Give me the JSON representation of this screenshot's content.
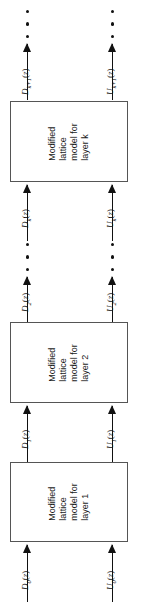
{
  "diagram": {
    "orientation": "rotated-90",
    "background_color": "#ffffff",
    "line_color": "#111111",
    "box_border_color": "#555555",
    "blocks": [
      {
        "id": "layer-k",
        "label": "Modified\nlattice\nmodel for\nlayer k",
        "line1": "Modified",
        "line2": "lattice",
        "line3": "model for",
        "line4": "layer k"
      },
      {
        "id": "layer-2",
        "label": "Modified\nlattice\nmodel for\nlayer 2",
        "line1": "Modified",
        "line2": "lattice",
        "line3": "model for",
        "line4": "layer 2"
      },
      {
        "id": "layer-1",
        "label": "Modified\nlattice\nmodel for\nlayer 1",
        "line1": "Modified",
        "line2": "lattice",
        "line3": "model for",
        "line4": "layer 1"
      }
    ],
    "signals": [
      {
        "id": "d-k-plus-1",
        "base": "D",
        "sub": "k+1",
        "arg": "(z)",
        "text": "D_{k+1}(z)"
      },
      {
        "id": "u-k-plus-1",
        "base": "U",
        "sub": "k+1",
        "arg": "(z)",
        "text": "U_{k+1}(z)"
      },
      {
        "id": "d-k",
        "base": "D",
        "sub": "k",
        "arg": "(z)",
        "text": "D_k(z)"
      },
      {
        "id": "u-k",
        "base": "U",
        "sub": "k",
        "arg": "(z)",
        "text": "U_k(z)"
      },
      {
        "id": "d-2",
        "base": "D",
        "sub": "2",
        "arg": "(z)",
        "text": "D_2(z)"
      },
      {
        "id": "u-2",
        "base": "U",
        "sub": "2",
        "arg": "(z)",
        "text": "U_2(z)"
      },
      {
        "id": "d-1",
        "base": "D",
        "sub": "1",
        "arg": "(z)",
        "text": "D_1(z)"
      },
      {
        "id": "u-1",
        "base": "U",
        "sub": "1",
        "arg": "(z)",
        "text": "U_1(z)"
      },
      {
        "id": "d-0",
        "base": "D",
        "sub": "0",
        "arg": "(z)",
        "text": "D_0(z)"
      },
      {
        "id": "u-0",
        "base": "U",
        "sub": "0",
        "arg": "(z)",
        "text": "U_0(z)"
      }
    ],
    "ellipses": [
      {
        "id": "top-left-dots",
        "count": 3
      },
      {
        "id": "top-right-dots",
        "count": 3
      },
      {
        "id": "mid-left-dots",
        "count": 3
      },
      {
        "id": "mid-right-dots",
        "count": 3
      }
    ]
  }
}
